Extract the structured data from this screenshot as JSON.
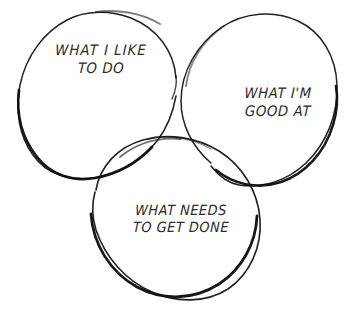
{
  "diagram": {
    "kind": "venn-diagram",
    "circle_count": 3,
    "background_color": "#ffffff",
    "stroke_color": "#101010",
    "text_color": "#2b2b2b",
    "style": "hand-drawn",
    "circles": [
      {
        "id": "what-i-like-to-do",
        "position": "top-left",
        "center_x": 99,
        "center_y": 95,
        "radius": 82
      },
      {
        "id": "what-im-good-at",
        "position": "top-right",
        "center_x": 248,
        "center_y": 100,
        "radius": 88
      },
      {
        "id": "what-needs-to-get-done",
        "position": "bottom-center",
        "center_x": 176,
        "center_y": 219,
        "radius": 81
      }
    ],
    "labels": {
      "like": {
        "line_1": "WHAT I LIKE",
        "line_2": "TO DO"
      },
      "good": {
        "line_1": "WHAT I'M",
        "line_2": "GOOD AT"
      },
      "needs": {
        "line_1": "WHAT NEEDS",
        "line_2": "TO GET DONE"
      }
    }
  }
}
